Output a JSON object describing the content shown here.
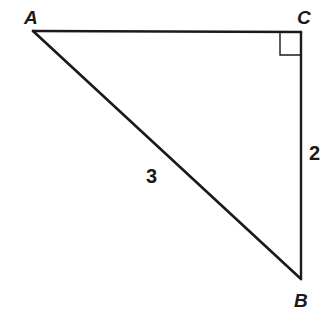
{
  "diagram": {
    "type": "right-triangle",
    "vertices": {
      "A": {
        "label": "A",
        "x": 33,
        "y": 31
      },
      "C": {
        "label": "C",
        "x": 301,
        "y": 32
      },
      "B": {
        "label": "B",
        "x": 301,
        "y": 279
      }
    },
    "right_angle_at": "C",
    "sides": {
      "AB": {
        "label": "3"
      },
      "CB": {
        "label": "2"
      }
    },
    "colors": {
      "stroke": "#1a1a1a",
      "background": "#ffffff"
    }
  }
}
